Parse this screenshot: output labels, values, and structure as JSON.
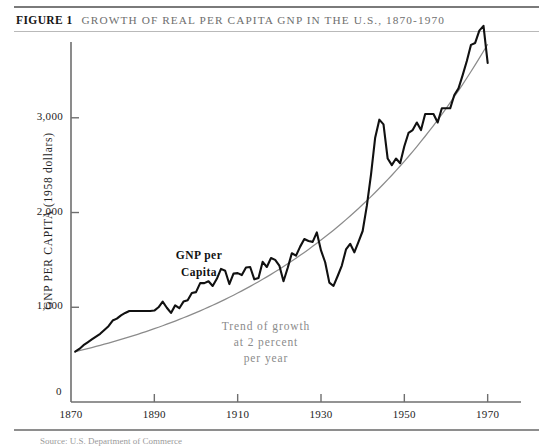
{
  "figure": {
    "label": "FIGURE 1",
    "title": "GROWTH OF REAL PER CAPITA GNP IN THE U.S., 1870-1970",
    "source_note": "Source: U.S. Department of Commerce"
  },
  "annotations": {
    "series_label_line1": "GNP per",
    "series_label_line2": "Capita",
    "trend_label_line1": "Trend of growth",
    "trend_label_line2": "at 2 percent",
    "trend_label_line3": "per year"
  },
  "colors": {
    "series": "#111111",
    "trend": "#8b8b8b",
    "axis": "#6f6f6f",
    "title": "#6e6e6e",
    "background": "#ffffff"
  },
  "chart_data": {
    "type": "line",
    "title": "GROWTH OF REAL PER CAPITA GNP IN THE U.S., 1870-1970",
    "xlabel": "",
    "ylabel": "GNP PER CAPITA (1958 dollars)",
    "xlim": [
      1870,
      1978
    ],
    "ylim": [
      0,
      3800
    ],
    "grid": false,
    "legend": "in-plot annotations",
    "zero_tick_label": "0",
    "yticks": [
      1000,
      2000,
      3000
    ],
    "ytick_labels": [
      "1,000",
      "2,000",
      "3,000"
    ],
    "xticks": [
      1870,
      1890,
      1910,
      1930,
      1950,
      1970
    ],
    "xtick_labels": [
      "1870",
      "1890",
      "1910",
      "1930",
      "1950",
      "1970"
    ],
    "series": [
      {
        "name": "GNP per Capita",
        "color": "#111111",
        "x": [
          1871,
          1872,
          1873,
          1874,
          1875,
          1876,
          1877,
          1878,
          1879,
          1880,
          1881,
          1882,
          1883,
          1884,
          1885,
          1886,
          1887,
          1888,
          1889,
          1890,
          1891,
          1892,
          1893,
          1894,
          1895,
          1896,
          1897,
          1898,
          1899,
          1900,
          1901,
          1902,
          1903,
          1904,
          1905,
          1906,
          1907,
          1908,
          1909,
          1910,
          1911,
          1912,
          1913,
          1914,
          1915,
          1916,
          1917,
          1918,
          1919,
          1920,
          1921,
          1922,
          1923,
          1924,
          1925,
          1926,
          1927,
          1928,
          1929,
          1930,
          1931,
          1932,
          1933,
          1934,
          1935,
          1936,
          1937,
          1938,
          1939,
          1940,
          1941,
          1942,
          1943,
          1944,
          1945,
          1946,
          1947,
          1948,
          1949,
          1950,
          1951,
          1952,
          1953,
          1954,
          1955,
          1956,
          1957,
          1958,
          1959,
          1960,
          1961,
          1962,
          1963,
          1964,
          1965,
          1966,
          1967,
          1968,
          1969,
          1970
        ],
        "y": [
          531,
          560,
          600,
          630,
          660,
          690,
          720,
          760,
          800,
          860,
          880,
          915,
          940,
          960,
          960,
          960,
          960,
          960,
          960,
          965,
          1000,
          1060,
          995,
          940,
          1020,
          990,
          1060,
          1075,
          1150,
          1160,
          1255,
          1255,
          1275,
          1225,
          1300,
          1405,
          1385,
          1245,
          1355,
          1360,
          1340,
          1420,
          1425,
          1295,
          1310,
          1480,
          1425,
          1520,
          1500,
          1440,
          1275,
          1415,
          1570,
          1545,
          1640,
          1720,
          1700,
          1690,
          1790,
          1600,
          1475,
          1260,
          1225,
          1330,
          1440,
          1610,
          1670,
          1580,
          1690,
          1805,
          2070,
          2400,
          2790,
          2980,
          2930,
          2570,
          2500,
          2570,
          2520,
          2700,
          2840,
          2870,
          2950,
          2870,
          3040,
          3040,
          3040,
          2950,
          3100,
          3100,
          3100,
          3240,
          3310,
          3450,
          3600,
          3770,
          3790,
          3920,
          3970,
          3580
        ]
      },
      {
        "name": "Trend of growth at 2 percent per year",
        "color": "#8b8b8b",
        "x": [
          1871,
          1880,
          1890,
          1900,
          1910,
          1920,
          1930,
          1940,
          1950,
          1960,
          1970
        ],
        "y": [
          531,
          635,
          774,
          944,
          1150,
          1402,
          1709,
          2084,
          2540,
          3097,
          3776
        ]
      }
    ]
  }
}
